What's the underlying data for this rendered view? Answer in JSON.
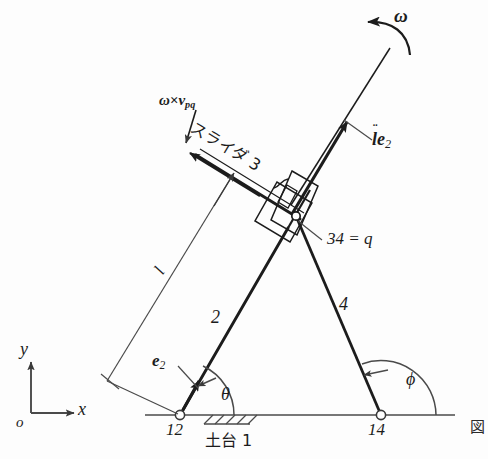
{
  "figure": {
    "corner_mark": "図",
    "line_color": "#1c1c1c",
    "thin_line_color": "#3a3a3a",
    "background": "#fdfdfd"
  },
  "axes": {
    "origin_label": "o",
    "x_label": "x",
    "y_label": "y"
  },
  "labels": {
    "omega": "ω",
    "omega_cross_v": "ω×",
    "v_symbol": "v",
    "v_sub": "pq",
    "slider3": "スライダ 3",
    "ddot_l": "l",
    "ddot_marks": "¨",
    "e2_base": "e",
    "e2_sub": "2",
    "joint_34": "34 = q",
    "link2": "2",
    "link4": "4",
    "joint12": "12",
    "joint14": "14",
    "base1": "土台 1",
    "length_l": "l",
    "theta": "θ",
    "phi": "ϕ"
  },
  "geometry": {
    "joint12": {
      "x": 180,
      "y": 415
    },
    "joint14": {
      "x": 381,
      "y": 415
    },
    "joint34": {
      "x": 296,
      "y": 216
    },
    "rod_tip": {
      "x": 390,
      "y": 48
    },
    "slider_far_end": {
      "x": 189,
      "y": 152
    },
    "ground_y": 415,
    "ground_x_start": 145,
    "ground_x_end": 455,
    "theta_deg": 63,
    "phi_deg": 113
  },
  "annotations": [
    {
      "name": "angular-velocity",
      "text": "ω"
    },
    {
      "name": "relative-velocity-term",
      "text": "ω×v_pq"
    },
    {
      "name": "slider-link-3",
      "text": "スライダ 3"
    },
    {
      "name": "acceleration-term",
      "text": "l̈e_2"
    },
    {
      "name": "unit-vector-e2",
      "text": "e_2"
    },
    {
      "name": "joint-34-q",
      "text": "34 = q"
    },
    {
      "name": "link-2",
      "text": "2"
    },
    {
      "name": "link-4",
      "text": "4"
    },
    {
      "name": "joint-12",
      "text": "12"
    },
    {
      "name": "joint-14",
      "text": "14"
    },
    {
      "name": "ground-base-1",
      "text": "土台 1"
    },
    {
      "name": "length-l",
      "text": "l"
    },
    {
      "name": "angle-theta",
      "text": "θ"
    },
    {
      "name": "angle-phi",
      "text": "ϕ"
    }
  ]
}
